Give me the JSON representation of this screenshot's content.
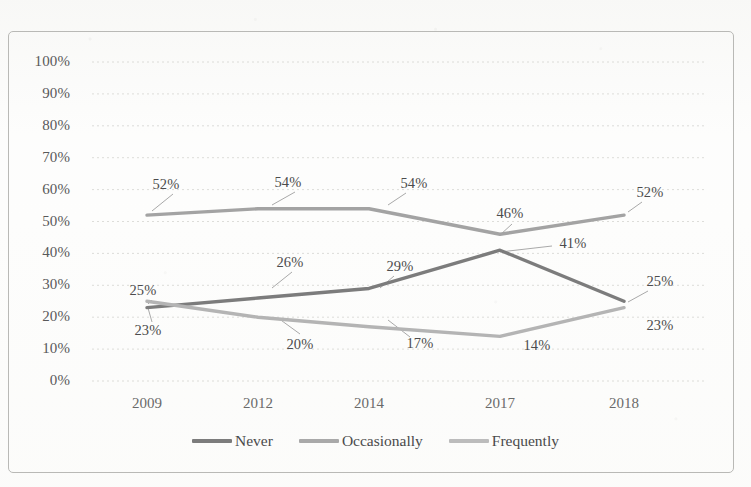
{
  "chart_data": {
    "type": "line",
    "title": "",
    "subtitle": "",
    "xlabel": "",
    "ylabel": "",
    "categories": [
      "2009",
      "2012",
      "2014",
      "2017",
      "2018"
    ],
    "ylim": [
      0,
      100
    ],
    "y_ticks": [
      "0%",
      "10%",
      "20%",
      "30%",
      "40%",
      "50%",
      "60%",
      "70%",
      "80%",
      "90%",
      "100%"
    ],
    "grid": "horizontal-dotted",
    "legend_position": "bottom-center",
    "series": [
      {
        "name": "Never",
        "color": "#7c7c7c",
        "values": [
          23,
          26,
          29,
          41,
          25
        ],
        "labels": [
          "23%",
          "26%",
          "29%",
          "41%",
          "25%"
        ]
      },
      {
        "name": "Occasionally",
        "color": "#a3a3a3",
        "values": [
          52,
          54,
          54,
          46,
          52
        ],
        "labels": [
          "52%",
          "54%",
          "54%",
          "46%",
          "52%"
        ]
      },
      {
        "name": "Frequently",
        "color": "#b4b4b4",
        "values": [
          25,
          20,
          17,
          14,
          23
        ],
        "labels": [
          "25%",
          "20%",
          "17%",
          "14%",
          "23%"
        ]
      }
    ],
    "data_labels": [
      {
        "text": "52%",
        "x": 166,
        "y": 184,
        "leader": [
          173,
          194,
          152,
          211
        ]
      },
      {
        "text": "54%",
        "x": 288,
        "y": 182,
        "leader": [
          295,
          192,
          272,
          205
        ]
      },
      {
        "text": "54%",
        "x": 414,
        "y": 183,
        "leader": [
          406,
          193,
          388,
          205
        ]
      },
      {
        "text": "46%",
        "x": 510,
        "y": 213,
        "leader": [
          512,
          224,
          500,
          235
        ]
      },
      {
        "text": "52%",
        "x": 650,
        "y": 192,
        "leader": [
          642,
          202,
          628,
          212
        ]
      },
      {
        "text": "25%",
        "x": 143,
        "y": 290,
        "leader": [
          152,
          300,
          148,
          304
        ]
      },
      {
        "text": "26%",
        "x": 290,
        "y": 262,
        "leader": [
          292,
          272,
          272,
          288
        ]
      },
      {
        "text": "29%",
        "x": 400,
        "y": 266,
        "leader": [
          394,
          276,
          380,
          288
        ]
      },
      {
        "text": "41%",
        "x": 573,
        "y": 243,
        "leader": [
          552,
          246,
          500,
          252
        ]
      },
      {
        "text": "25%",
        "x": 660,
        "y": 281,
        "leader": [
          648,
          291,
          628,
          302
        ]
      },
      {
        "text": "23%",
        "x": 148,
        "y": 330,
        "leader": [
          152,
          322,
          148,
          308
        ]
      },
      {
        "text": "20%",
        "x": 300,
        "y": 344,
        "leader": [
          300,
          334,
          278,
          318
        ]
      },
      {
        "text": "17%",
        "x": 420,
        "y": 343,
        "leader": [
          410,
          337,
          388,
          320
        ]
      },
      {
        "text": "14%",
        "x": 537,
        "y": 345,
        "leader": [
          0,
          0,
          0,
          0
        ]
      },
      {
        "text": "23%",
        "x": 660,
        "y": 325,
        "leader": [
          0,
          0,
          0,
          0
        ]
      }
    ]
  },
  "legend": {
    "items": [
      {
        "label": "Never",
        "color": "#7c7c7c"
      },
      {
        "label": "Occasionally",
        "color": "#a9a9a9"
      },
      {
        "label": "Frequently",
        "color": "#bcbcbc"
      }
    ]
  },
  "axis": {
    "y_labels": [
      "100%",
      "90%",
      "80%",
      "70%",
      "60%",
      "50%",
      "40%",
      "30%",
      "20%",
      "10%",
      "0%"
    ],
    "x_labels": [
      "2009",
      "2012",
      "2014",
      "2017",
      "2018"
    ]
  }
}
